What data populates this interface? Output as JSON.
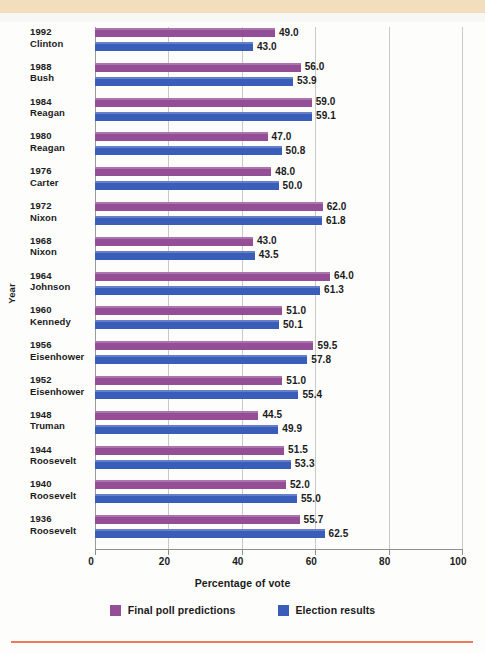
{
  "colors": {
    "poll": "#944e96",
    "result": "#3a5dba",
    "banner": "#f2debc",
    "rule": "#ef7a5a",
    "grid": "#c9c9c9",
    "axis": "#8f8f8f",
    "plot_background": "#fdfdfc",
    "text": "#1b1b1b"
  },
  "chart_data": {
    "type": "bar",
    "orientation": "horizontal",
    "title": "",
    "xlabel": "Percentage of vote",
    "ylabel": "Year",
    "xlim": [
      0,
      100
    ],
    "xticks": [
      0,
      20,
      40,
      60,
      80,
      100
    ],
    "xtick_labels": [
      "0",
      "20",
      "40",
      "60",
      "80",
      "100"
    ],
    "grid": "vertical",
    "legend_position": "bottom",
    "categories": [
      "1992 Clinton",
      "1988 Bush",
      "1984 Reagan",
      "1980 Reagan",
      "1976 Carter",
      "1972 Nixon",
      "1968 Nixon",
      "1964 Johnson",
      "1960 Kennedy",
      "1956 Eisenhower",
      "1952 Eisenhower",
      "1948 Truman",
      "1944 Roosevelt",
      "1940 Roosevelt",
      "1936 Roosevelt"
    ],
    "series": [
      {
        "name": "Final poll predictions",
        "color": "#944e96",
        "values": [
          49.0,
          56.0,
          59.0,
          47.0,
          48.0,
          62.0,
          43.0,
          64.0,
          51.0,
          59.5,
          51.0,
          44.5,
          51.5,
          52.0,
          55.7
        ]
      },
      {
        "name": "Election results",
        "color": "#3a5dba",
        "values": [
          43.0,
          53.9,
          59.1,
          50.8,
          50.0,
          61.8,
          43.5,
          61.3,
          50.1,
          57.8,
          55.4,
          49.9,
          53.3,
          55.0,
          62.5
        ]
      }
    ]
  },
  "rows": [
    {
      "year": "1992",
      "name": "Clinton",
      "poll": "49.0",
      "result": "43.0"
    },
    {
      "year": "1988",
      "name": "Bush",
      "poll": "56.0",
      "result": "53.9"
    },
    {
      "year": "1984",
      "name": "Reagan",
      "poll": "59.0",
      "result": "59.1"
    },
    {
      "year": "1980",
      "name": "Reagan",
      "poll": "47.0",
      "result": "50.8"
    },
    {
      "year": "1976",
      "name": "Carter",
      "poll": "48.0",
      "result": "50.0"
    },
    {
      "year": "1972",
      "name": "Nixon",
      "poll": "62.0",
      "result": "61.8"
    },
    {
      "year": "1968",
      "name": "Nixon",
      "poll": "43.0",
      "result": "43.5"
    },
    {
      "year": "1964",
      "name": "Johnson",
      "poll": "64.0",
      "result": "61.3"
    },
    {
      "year": "1960",
      "name": "Kennedy",
      "poll": "51.0",
      "result": "50.1"
    },
    {
      "year": "1956",
      "name": "Eisenhower",
      "poll": "59.5",
      "result": "57.8"
    },
    {
      "year": "1952",
      "name": "Eisenhower",
      "poll": "51.0",
      "result": "55.4"
    },
    {
      "year": "1948",
      "name": "Truman",
      "poll": "44.5",
      "result": "49.9"
    },
    {
      "year": "1944",
      "name": "Roosevelt",
      "poll": "51.5",
      "result": "53.3"
    },
    {
      "year": "1940",
      "name": "Roosevelt",
      "poll": "52.0",
      "result": "55.0"
    },
    {
      "year": "1936",
      "name": "Roosevelt",
      "poll": "55.7",
      "result": "62.5"
    }
  ],
  "axis": {
    "xlabel": "Percentage of vote",
    "ylabel": "Year",
    "ticks": [
      "0",
      "20",
      "40",
      "60",
      "80",
      "100"
    ]
  },
  "legend": {
    "items": [
      {
        "label": "Final poll predictions",
        "color": "#944e96"
      },
      {
        "label": "Election results",
        "color": "#3a5dba"
      }
    ]
  }
}
